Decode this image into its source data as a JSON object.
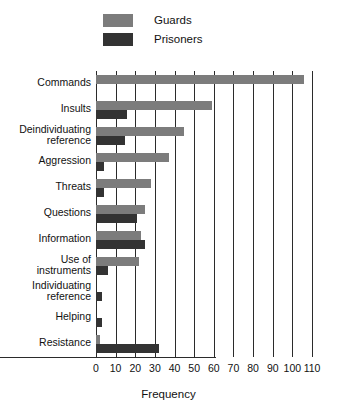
{
  "chart_data": {
    "type": "bar",
    "orientation": "horizontal",
    "title": "",
    "xlabel": "Frequency",
    "ylabel": "",
    "xlim": [
      0,
      110
    ],
    "xticks": [
      0,
      10,
      20,
      30,
      40,
      50,
      60,
      70,
      80,
      90,
      100,
      110
    ],
    "xtick_labels": [
      "0",
      "10",
      "20",
      "30",
      "40",
      "50",
      "60",
      "70",
      "80",
      "90",
      "100",
      "110"
    ],
    "grid": "vertical",
    "legend_position": "top-left",
    "categories": [
      "Commands",
      "Insults",
      "Deindividuating reference",
      "Aggression",
      "Threats",
      "Questions",
      "Information",
      "Use of instruments",
      "Individuating reference",
      "Helping",
      "Resistance"
    ],
    "category_lines": [
      [
        "Commands"
      ],
      [
        "Insults"
      ],
      [
        "Deindividuating",
        "reference"
      ],
      [
        "Aggression"
      ],
      [
        "Threats"
      ],
      [
        "Questions"
      ],
      [
        "Information"
      ],
      [
        "Use of",
        "instruments"
      ],
      [
        "Individuating",
        "reference"
      ],
      [
        "Helping"
      ],
      [
        "Resistance"
      ]
    ],
    "series": [
      {
        "name": "Guards",
        "color": "#7c7c7c",
        "values": [
          106,
          59,
          45,
          37,
          28,
          25,
          23,
          22,
          0,
          0,
          2
        ]
      },
      {
        "name": "Prisoners",
        "color": "#333333",
        "values": [
          0,
          16,
          15,
          4,
          4,
          21,
          25,
          6,
          3,
          3,
          32
        ]
      }
    ]
  },
  "legend": {
    "items": [
      {
        "label": "Guards",
        "color": "#7c7c7c",
        "swatch": "guards-swatch"
      },
      {
        "label": "Prisoners",
        "color": "#333333",
        "swatch": "prisoners-swatch"
      }
    ]
  },
  "axis": {
    "x_title": "Frequency"
  }
}
